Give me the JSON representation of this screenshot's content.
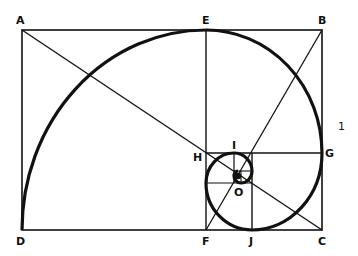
{
  "diagram": {
    "labels": {
      "A": "A",
      "B": "B",
      "C": "C",
      "D": "D",
      "E": "E",
      "F": "F",
      "G": "G",
      "H": "H",
      "I": "I",
      "J": "J",
      "O": "O",
      "side": "1"
    },
    "colors": {
      "line": "#111111",
      "background": "#ffffff"
    }
  }
}
